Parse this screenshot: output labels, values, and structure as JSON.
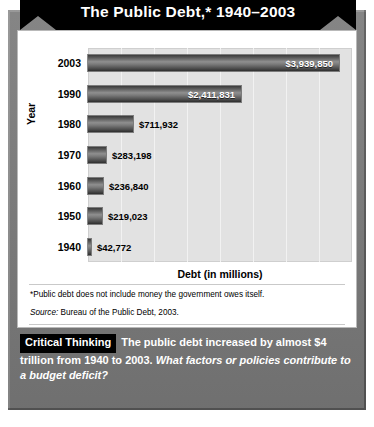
{
  "title": "The Public Debt,* 1940–2003",
  "chart_data": {
    "type": "bar",
    "orientation": "horizontal",
    "title": "The Public Debt,* 1940–2003",
    "xlabel": "Debt (in millions)",
    "ylabel": "Year",
    "categories": [
      "2003",
      "1990",
      "1980",
      "1970",
      "1960",
      "1950",
      "1940"
    ],
    "values": [
      3939850,
      2411831,
      711932,
      283198,
      236840,
      219023,
      42772
    ],
    "value_labels": [
      "$3,939,850",
      "$2,411,831",
      "$711,932",
      "$283,198",
      "$236,840",
      "$219,023",
      "$42,772"
    ],
    "xlim": [
      0,
      4150000
    ],
    "xticklabels": [],
    "grid": true,
    "gridlines": 7,
    "legend": "none",
    "bar_color": "#6f6f6f",
    "plot_background": "#e2e2e2"
  },
  "notes": {
    "footnote": "*Public debt does not include money the government owes itself.",
    "source_word": "Source:",
    "source_rest": " Bureau of the Public Debt, 2003."
  },
  "critical_thinking": {
    "badge": "Critical Thinking",
    "statement": "The public debt increased by almost $4 trillion from 1940 to 2003.",
    "question": "What factors or policies contribute to a budget deficit?"
  },
  "colors": {
    "frame": "#7c7c7c",
    "ribbon": "#000000",
    "card": "#ffffff",
    "plot": "#e2e2e2"
  }
}
